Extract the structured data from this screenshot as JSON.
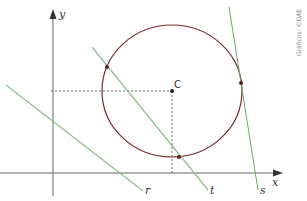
{
  "diagram": {
    "axes": {
      "x_label": "x",
      "y_label": "y"
    },
    "center": {
      "label": "C"
    },
    "lines": [
      {
        "id": "r",
        "label": "r",
        "relation": "exterior"
      },
      {
        "id": "t",
        "label": "t",
        "relation": "secant"
      },
      {
        "id": "s",
        "label": "s",
        "relation": "tangent"
      }
    ],
    "credit": "Gráficos: ©DAE",
    "colors": {
      "axis": "#555555",
      "circle": "#7a2a2a",
      "lines": "#8cc08c",
      "points": "#5a1f1f",
      "dashed": "#444444"
    }
  }
}
